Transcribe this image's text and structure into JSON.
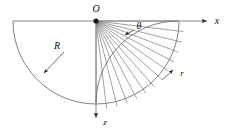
{
  "figure": {
    "name": "polar-half-plane-diagram",
    "background_color": "#ffffff",
    "line_color": "#6f6f6f",
    "label_color": "#111111"
  },
  "labels": {
    "origin": "O",
    "x_axis": "x",
    "z_axis": "z",
    "radius": "R",
    "angle": "θ",
    "radial": "r"
  },
  "geometry": {
    "origin": {
      "x": 96,
      "y": 21
    },
    "outer_radius": 83,
    "inner_arc_radius": 82,
    "x_axis": {
      "x1": 13,
      "y1": 21,
      "x2": 210,
      "y2": 21
    },
    "z_axis": {
      "x1": 96,
      "y1": 21,
      "x2": 96,
      "y2": 122
    },
    "ray_count": 13,
    "ray_start_deg": 0,
    "ray_end_deg": 90,
    "tick_overshoot": 6
  },
  "annotations": {
    "radius_leader": {
      "from_x": 62,
      "from_y": 54,
      "to_x": 42,
      "to_y": 75
    },
    "angle_leader": {
      "from_x": 134,
      "from_y": 30,
      "to_x": 124,
      "to_y": 36
    },
    "radial_leader": {
      "from_x": 162,
      "from_y": 80,
      "to_x": 174,
      "to_y": 69
    },
    "radius_label_pos": {
      "x": 57,
      "y": 47
    },
    "angle_label_pos": {
      "x": 138,
      "y": 27
    },
    "radial_label_pos": {
      "x": 182,
      "y": 73
    },
    "origin_label_pos": {
      "x": 96,
      "y": 10
    },
    "x_label_pos": {
      "x": 217,
      "y": 21
    },
    "z_label_pos": {
      "x": 105,
      "y": 123
    }
  }
}
